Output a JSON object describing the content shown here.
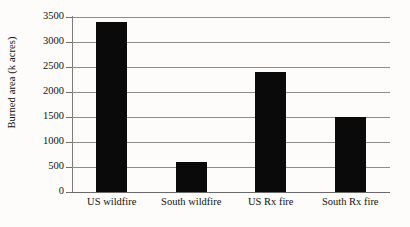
{
  "chart_data": {
    "type": "bar",
    "title": "",
    "subtitle": "",
    "xlabel": "",
    "ylabel": "Burned area (k acres)",
    "categories": [
      "US wildfire",
      "South wildfire",
      "US Rx fire",
      "South Rx fire"
    ],
    "values": [
      3400,
      600,
      2400,
      1500
    ],
    "ylim": [
      0,
      3500
    ],
    "ytick_labels": [
      "0",
      "500",
      "1000",
      "1500",
      "2000",
      "2500",
      "3000",
      "3500"
    ],
    "ytick_values": [
      0,
      500,
      1000,
      1500,
      2000,
      2500,
      3000,
      3500
    ],
    "grid": true,
    "legend": false,
    "legend_position": "none",
    "bar_color": "#0a0a0a",
    "gridline_color": "#8d8d8d",
    "axis_color": "#7c7c7c",
    "background_color": "#fdfcfa"
  }
}
